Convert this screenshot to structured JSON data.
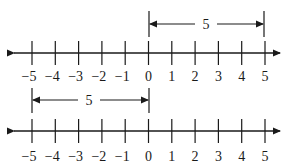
{
  "diagram": {
    "number_lines": [
      {
        "id": "top",
        "tick_labels": [
          "−5",
          "−4",
          "−3",
          "−2",
          "−1",
          "0",
          "1",
          "2",
          "3",
          "4",
          "5"
        ],
        "bracket": {
          "from": 0,
          "to": 5,
          "label": "5"
        }
      },
      {
        "id": "bottom",
        "tick_labels": [
          "−5",
          "−4",
          "−3",
          "−2",
          "−1",
          "0",
          "1",
          "2",
          "3",
          "4",
          "5"
        ],
        "bracket": {
          "from": -5,
          "to": 0,
          "label": "5"
        }
      }
    ],
    "colors": {
      "ink": "#1a1a1a",
      "background": "#ffffff"
    }
  }
}
